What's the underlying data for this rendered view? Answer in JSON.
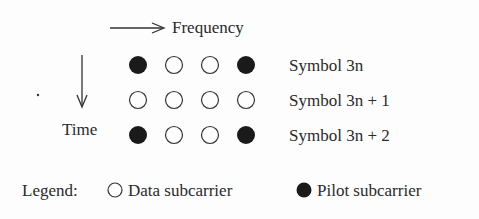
{
  "axes": {
    "frequency_label": "Frequency",
    "time_label": "Time"
  },
  "grid": {
    "rows": [
      {
        "label": "Symbol 3n",
        "cells": [
          "pilot",
          "data",
          "data",
          "pilot"
        ]
      },
      {
        "label": "Symbol 3n + 1",
        "cells": [
          "data",
          "data",
          "data",
          "data"
        ]
      },
      {
        "label": "Symbol 3n + 2",
        "cells": [
          "pilot",
          "data",
          "data",
          "pilot"
        ]
      }
    ]
  },
  "legend": {
    "title": "Legend:",
    "data_label": "Data subcarrier",
    "pilot_label": "Pilot subcarrier"
  },
  "colors": {
    "ink": "#2a2a2a",
    "pilot_fill": "#1a1a1a",
    "background": "#fdfdfd"
  }
}
